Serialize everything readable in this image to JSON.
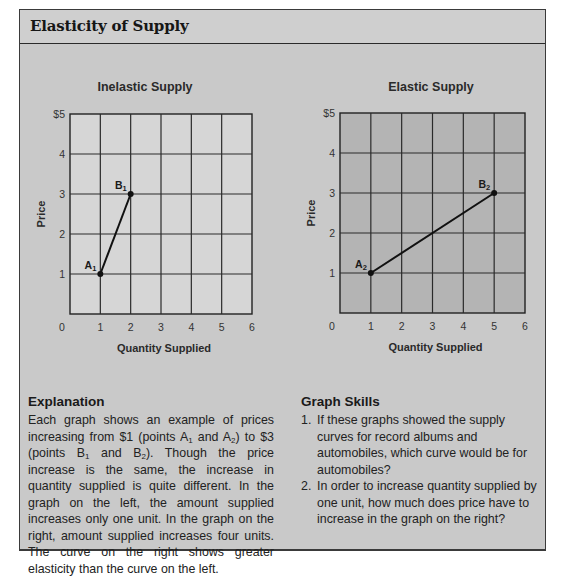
{
  "header": {
    "title": "Elasticity of Supply"
  },
  "charts": {
    "left": {
      "title": "Inelastic Supply",
      "ylabel": "Price",
      "xlabel": "Quantity Supplied",
      "yticks": [
        "$5",
        "4",
        "3",
        "2",
        "1"
      ],
      "xticks": [
        "0",
        "1",
        "2",
        "3",
        "4",
        "5",
        "6"
      ],
      "points": [
        {
          "label": "A",
          "sub": "1",
          "x": 1,
          "y": 1
        },
        {
          "label": "B",
          "sub": "1",
          "x": 2,
          "y": 3
        }
      ],
      "fill": "#d6d6d6"
    },
    "right": {
      "title": "Elastic Supply",
      "ylabel": "Price",
      "xlabel": "Quantity Supplied",
      "yticks": [
        "$5",
        "4",
        "3",
        "2",
        "1"
      ],
      "xticks": [
        "0",
        "1",
        "2",
        "3",
        "4",
        "5",
        "6"
      ],
      "points": [
        {
          "label": "A",
          "sub": "2",
          "x": 1,
          "y": 1
        },
        {
          "label": "B",
          "sub": "2",
          "x": 5,
          "y": 3
        }
      ],
      "fill": "#b4b4b4"
    }
  },
  "chart_data": [
    {
      "type": "line",
      "title": "Inelastic Supply",
      "xlabel": "Quantity Supplied",
      "ylabel": "Price",
      "x": [
        1,
        2
      ],
      "y": [
        1,
        3
      ],
      "point_labels": [
        "A1",
        "B1"
      ],
      "xlim": [
        0,
        6
      ],
      "ylim": [
        0,
        5
      ],
      "ytick_labels": [
        "$5",
        "4",
        "3",
        "2",
        "1"
      ],
      "xtick_labels": [
        "0",
        "1",
        "2",
        "3",
        "4",
        "5",
        "6"
      ],
      "grid": true
    },
    {
      "type": "line",
      "title": "Elastic Supply",
      "xlabel": "Quantity Supplied",
      "ylabel": "Price",
      "x": [
        1,
        5
      ],
      "y": [
        1,
        3
      ],
      "point_labels": [
        "A2",
        "B2"
      ],
      "xlim": [
        0,
        6
      ],
      "ylim": [
        0,
        5
      ],
      "ytick_labels": [
        "$5",
        "4",
        "3",
        "2",
        "1"
      ],
      "xtick_labels": [
        "0",
        "1",
        "2",
        "3",
        "4",
        "5",
        "6"
      ],
      "grid": true
    }
  ],
  "explanation": {
    "title": "Explanation",
    "text_parts": {
      "p1": "Each graph shows an example of prices increasing from $1 (points A",
      "s1": "1",
      "p2": " and A",
      "s2": "2",
      "p3": ") to $3 (points B",
      "s3": "1",
      "p4": " and B",
      "s4": "2",
      "p5": "). Though the price increase is the same, the increase in quantity supplied is quite different. In the graph on the left, the amount supplied increases only one unit. In the graph on the right, amount supplied increases four units. The curve on the right shows greater elasticity than the curve on the left."
    }
  },
  "graph_skills": {
    "title": "Graph Skills",
    "items": [
      {
        "num": "1.",
        "text": "If these graphs showed the supply curves for record albums and automobiles, which curve would be for automobiles?"
      },
      {
        "num": "2.",
        "text": "In order to increase quantity supplied by one unit, how much does price have to increase in the graph on the right?"
      }
    ]
  }
}
